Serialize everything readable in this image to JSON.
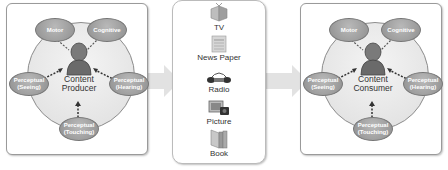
{
  "producer": {
    "center_label_line1": "Content",
    "center_label_line2": "Producer",
    "nodes": {
      "motor": "Motor",
      "cognitive": "Cognitive",
      "seeing_line1": "Perceptual",
      "seeing_line2": "(Seeing)",
      "hearing_line1": "Perceptual",
      "hearing_line2": "(Hearing)",
      "touching_line1": "Perceptual",
      "touching_line2": "(Touching)"
    }
  },
  "media": {
    "items": [
      {
        "label": "TV",
        "icon": "tv-icon"
      },
      {
        "label": "News Paper",
        "icon": "newspaper-icon"
      },
      {
        "label": "Radio",
        "icon": "radio-icon"
      },
      {
        "label": "Picture",
        "icon": "picture-icon"
      },
      {
        "label": "Book",
        "icon": "book-icon"
      }
    ]
  },
  "consumer": {
    "center_label_line1": "Content",
    "center_label_line2": "Consumer",
    "nodes": {
      "motor": "Motor",
      "cognitive": "Cognitive",
      "seeing_line1": "Perceptual",
      "seeing_line2": "(Seeing)",
      "hearing_line1": "Perceptual",
      "hearing_line2": "(Hearing)",
      "touching_line1": "Perceptual",
      "touching_line2": "(Touching)"
    }
  },
  "colors": {
    "oval": "#9a9a9a",
    "circle": "#e6e6e6",
    "flow_arrow": "#d8d8d8"
  }
}
